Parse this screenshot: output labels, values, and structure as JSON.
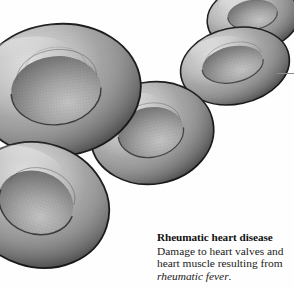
{
  "figure": {
    "style": "grayscale stipple engraving",
    "background_color": "#fefefe",
    "outline_color": "#1c1c1c",
    "tones": {
      "highlight": "#cfcfcf",
      "light": "#b8b8b8",
      "mid": "#9a9a9a",
      "shade": "#7c7c7c",
      "dark": "#626262",
      "deep": "#4a4a4a"
    },
    "cells": [
      {
        "name": "cell-top-right",
        "cx": 253,
        "cy": 18,
        "rx": 46,
        "ry": 33,
        "rotate": -8,
        "pit_rx": 25,
        "pit_ry": 15
      },
      {
        "name": "cell-upper-right",
        "cx": 235,
        "cy": 66,
        "rx": 55,
        "ry": 38,
        "rotate": -12,
        "pit_rx": 31,
        "pit_ry": 18
      },
      {
        "name": "cell-center",
        "cx": 152,
        "cy": 133,
        "rx": 62,
        "ry": 51,
        "rotate": -10,
        "pit_rx": 33,
        "pit_ry": 25
      },
      {
        "name": "cell-large-left",
        "cx": 58,
        "cy": 90,
        "rx": 83,
        "ry": 66,
        "rotate": -6,
        "pit_rx": 45,
        "pit_ry": 34
      },
      {
        "name": "cell-bottom-left",
        "cx": 38,
        "cy": 205,
        "rx": 72,
        "ry": 62,
        "rotate": 18,
        "pit_rx": 38,
        "pit_ry": 31
      }
    ],
    "rule": {
      "name": "horizontal-rule",
      "x": 278,
      "y": 73,
      "width": 16,
      "color": "#8c8c8c"
    }
  },
  "caption": {
    "title": "Rheumatic heart disease",
    "body_line_1": "Damage to heart valves and",
    "body_line_2": "heart muscle resulting from",
    "term": "rheumatic fever",
    "terminator": "."
  }
}
